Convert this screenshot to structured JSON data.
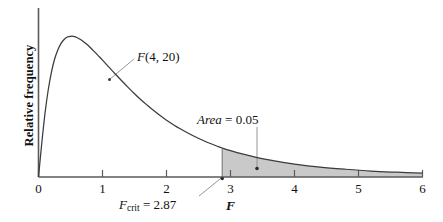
{
  "figure": {
    "kind": "f-distribution-density-plot",
    "background_color": "#ffffff",
    "curve_color": "#3b3b3b",
    "axis_color": "#5a5a5a",
    "shade_color": "#c9c9c9",
    "shade_edge_color": "#6e6e6e",
    "leader_color": "#8a8a8a",
    "text_color": "#111111"
  },
  "axes": {
    "y_title": "Relative frequency",
    "x_title": "F",
    "x_ticks": [
      "0",
      "1",
      "2",
      "3",
      "4",
      "5",
      "6"
    ]
  },
  "annotations": {
    "distribution": {
      "name_italic": "F",
      "params": "(4, 20)",
      "full": "F(4, 20)"
    },
    "area": {
      "word": "Area",
      "equals_value": " = 0.05",
      "full": "Area = 0.05",
      "value": "0.05"
    },
    "fcrit": {
      "var": "F",
      "sub": "crit",
      "equals_value": " = 2.87",
      "full": "Fcrit = 2.87",
      "value": "2.87"
    }
  },
  "chart_data": {
    "type": "area",
    "title": "",
    "subtitle": "",
    "xlabel": "F",
    "ylabel": "Relative frequency",
    "xlim": [
      0,
      6
    ],
    "ylim": [
      0,
      0.82
    ],
    "grid": false,
    "legend": "none",
    "distribution": "F",
    "df1": 4,
    "df2": 20,
    "peak_x": 0.52,
    "critical_value": 2.87,
    "tail_area": 0.05,
    "xticks": [
      0,
      1,
      2,
      3,
      4,
      5,
      6
    ],
    "xtick_labels": [
      "0",
      "1",
      "2",
      "3",
      "4",
      "5",
      "6"
    ],
    "yticks": [],
    "ytick_labels": [],
    "shaded_region": {
      "from": 2.87,
      "to": 6,
      "label": "Area = 0.05",
      "fill": "#c9c9c9"
    },
    "series": [
      {
        "name": "F(4, 20) density",
        "x": [
          0.0,
          0.05,
          0.1,
          0.15,
          0.2,
          0.25,
          0.3,
          0.35,
          0.4,
          0.45,
          0.5,
          0.55,
          0.6,
          0.65,
          0.7,
          0.75,
          0.8,
          0.85,
          0.9,
          0.95,
          1.0,
          1.1,
          1.2,
          1.3,
          1.4,
          1.5,
          1.6,
          1.7,
          1.8,
          1.9,
          2.0,
          2.2,
          2.4,
          2.6,
          2.8,
          2.87,
          3.0,
          3.2,
          3.4,
          3.6,
          3.8,
          4.0,
          4.4,
          4.8,
          5.2,
          5.6,
          6.0
        ],
        "y": [
          0.0,
          0.166,
          0.316,
          0.434,
          0.524,
          0.591,
          0.638,
          0.671,
          0.692,
          0.704,
          0.708,
          0.707,
          0.702,
          0.693,
          0.682,
          0.669,
          0.654,
          0.638,
          0.622,
          0.605,
          0.588,
          0.553,
          0.518,
          0.484,
          0.451,
          0.419,
          0.389,
          0.361,
          0.334,
          0.309,
          0.286,
          0.245,
          0.21,
          0.18,
          0.154,
          0.146,
          0.133,
          0.115,
          0.099,
          0.086,
          0.075,
          0.065,
          0.05,
          0.039,
          0.03,
          0.024,
          0.019
        ]
      }
    ],
    "annotations": [
      {
        "text": "F(4, 20)",
        "x": 1.55,
        "y": 0.62,
        "points_to": {
          "x": 1.15,
          "y": 0.5
        }
      },
      {
        "text": "Area = 0.05",
        "x": 3.45,
        "y": 0.33,
        "points_to": {
          "x": 3.42,
          "y": 0.03
        }
      },
      {
        "text": "Fcrit = 2.87",
        "x": 2.05,
        "y": -0.1,
        "points_to": {
          "x": 2.87,
          "y": 0.0
        }
      }
    ]
  }
}
